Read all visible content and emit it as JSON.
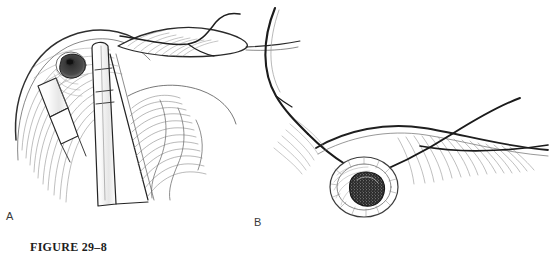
{
  "figure": {
    "caption": "FIGURE 29–8",
    "background_color": "#ffffff",
    "ink_color": "#222222",
    "width": 554,
    "height": 263
  },
  "panels": [
    {
      "id": "A",
      "label": "A",
      "label_x": 6,
      "label_y": 210,
      "description": "Surgical field with tissue flap retracted, two instruments grasping the stoma margin, suture thread passing over the upper tissue edge, hatched shading on surrounding tissue"
    },
    {
      "id": "B",
      "label": "B",
      "label_x": 254,
      "label_y": 216,
      "description": "Completed round stoma with stippled dark lumen, curved surgical needle with suture entering from upper left and suture strands crossing to the right over hatched tissue"
    }
  ],
  "artwork": {
    "style": "pen-and-ink medical line illustration",
    "panel_a": {
      "instrument_count": 2,
      "instrument_names": [
        "forceps-upper",
        "forceps-lower"
      ],
      "stoma_label": "dark opening",
      "suture_threads": 1
    },
    "panel_b": {
      "needle_label": "curved surgical needle",
      "stoma_label": "round stippled stoma",
      "suture_threads": 2
    }
  }
}
